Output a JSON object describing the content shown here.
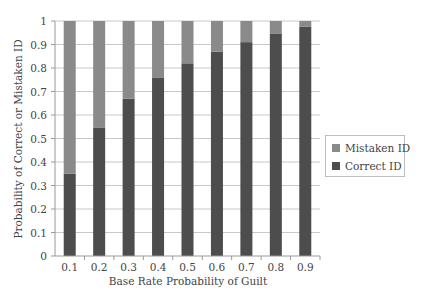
{
  "chart_data": {
    "type": "bar",
    "stacked": true,
    "title": "",
    "xlabel": "Base Rate Probability of Guilt",
    "ylabel": "Probability of Correct or Mistaken ID",
    "categories": [
      "0.1",
      "0.2",
      "0.3",
      "0.4",
      "0.5",
      "0.6",
      "0.7",
      "0.8",
      "0.9"
    ],
    "series": [
      {
        "name": "Correct ID",
        "color": "#4d4d4d",
        "values": [
          0.35,
          0.545,
          0.67,
          0.76,
          0.82,
          0.87,
          0.91,
          0.945,
          0.975
        ]
      },
      {
        "name": "Mistaken ID",
        "color": "#8a8a8a",
        "values": [
          0.65,
          0.455,
          0.33,
          0.24,
          0.18,
          0.13,
          0.09,
          0.055,
          0.025
        ]
      }
    ],
    "ylim": [
      0,
      1
    ],
    "yticks": [
      "0",
      "0.1",
      "0.2",
      "0.3",
      "0.4",
      "0.5",
      "0.6",
      "0.7",
      "0.8",
      "0.9",
      "1"
    ],
    "grid": true,
    "legend_position": "right"
  },
  "legend": {
    "items": [
      {
        "label": "Mistaken ID",
        "color": "#8a8a8a"
      },
      {
        "label": "Correct ID",
        "color": "#4d4d4d"
      }
    ]
  }
}
